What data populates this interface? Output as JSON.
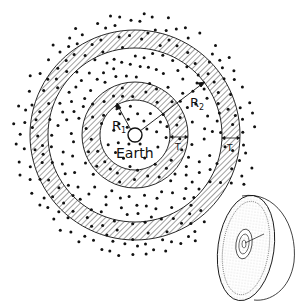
{
  "diagram": {
    "center_label": "Earth",
    "inner_radius_label": "R",
    "inner_radius_sub": "1",
    "outer_radius_label": "R",
    "outer_radius_sub": "2",
    "thickness_label_inner": "T",
    "thickness_label_outer": "T",
    "colors": {
      "ink": "#111111",
      "background": "#ffffff",
      "stipple": "#444444"
    }
  }
}
